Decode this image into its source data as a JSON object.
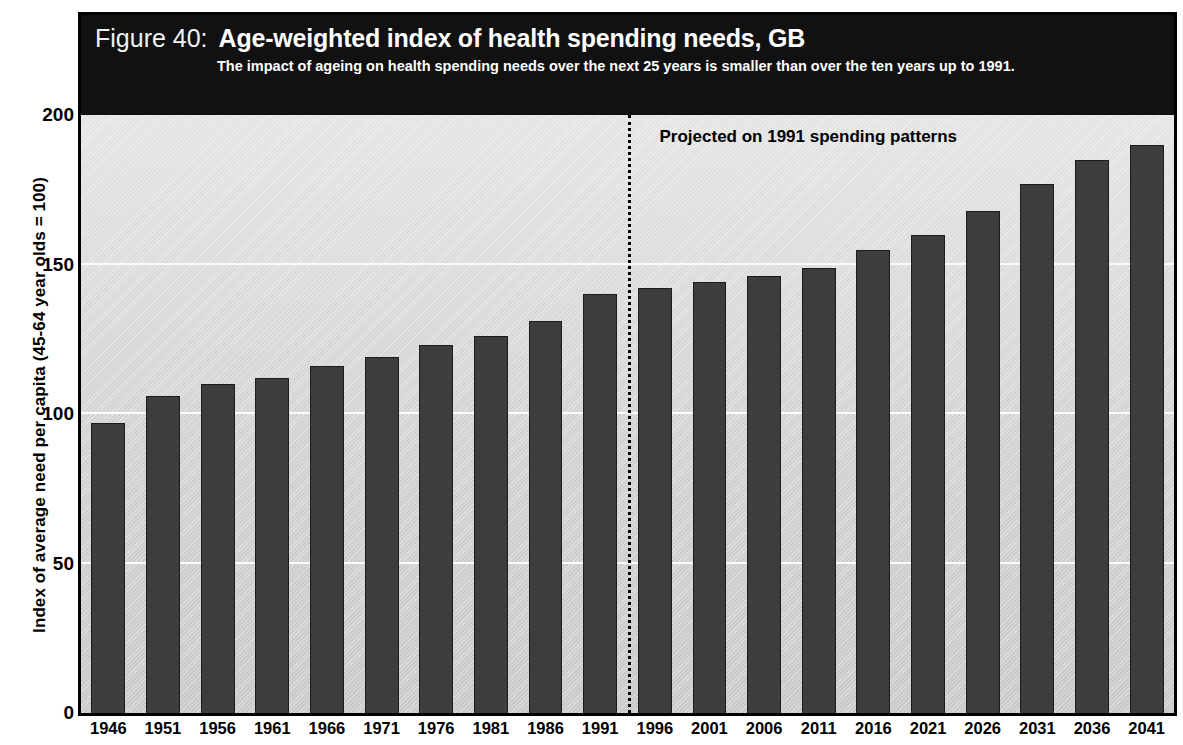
{
  "header": {
    "figure_number": "Figure 40:",
    "title": "Age-weighted index of health spending needs, GB",
    "subtitle": "The impact of ageing on health spending needs over the next 25 years is smaller than over the ten years up to 1991."
  },
  "colors": {
    "band_background": "#111111",
    "band_text": "#ffffff",
    "plot_background": "#d4d4d4",
    "bar_fill": "#3d3d3d",
    "bar_stroke": "#1c1c1c",
    "gridline": "#fbfbfb",
    "axis": "#000000"
  },
  "chart_data": {
    "type": "bar",
    "title": "Age-weighted index of health spending needs, GB",
    "subtitle": "The impact of ageing on health spending needs over the next 25 years is smaller than over the ten years up to 1991.",
    "xlabel": "",
    "ylabel": "Index of average need per capita (45-64 year olds = 100)",
    "ylim": [
      0,
      200
    ],
    "yticks": [
      0,
      50,
      100,
      150,
      200
    ],
    "grid": true,
    "legend": null,
    "categories": [
      "1946",
      "1951",
      "1956",
      "1961",
      "1966",
      "1971",
      "1976",
      "1981",
      "1986",
      "1991",
      "1996",
      "2001",
      "2006",
      "2011",
      "2016",
      "2021",
      "2026",
      "2031",
      "2036",
      "2041"
    ],
    "values": [
      97,
      106,
      110,
      112,
      116,
      119,
      123,
      126,
      131,
      140,
      142,
      144,
      146,
      149,
      155,
      160,
      168,
      177,
      185,
      190
    ],
    "annotations": [
      {
        "text": "Projected on 1991 spending patterns",
        "kind": "divider-label",
        "after_category": "1991"
      }
    ],
    "divider": {
      "style": "dotted",
      "between": [
        "1991",
        "1996"
      ],
      "label": "Projected on 1991 spending patterns"
    }
  }
}
